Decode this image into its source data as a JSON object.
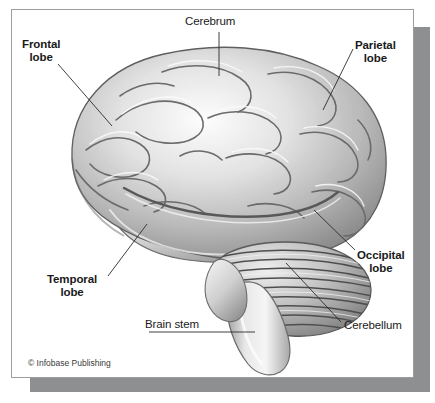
{
  "figure": {
    "copyright": "© Infobase Publishing",
    "card_background": "#ffffff",
    "card_border_color": "#9a9c9e",
    "shadow_color": "#8d8f91",
    "label_color": "#1a1a1a",
    "leader_line_color": "#2b2b2b"
  },
  "labels": [
    {
      "name": "cerebrum",
      "line1": "Cerebrum",
      "line2": "",
      "weight": "regular"
    },
    {
      "name": "frontal-lobe",
      "line1": "Frontal",
      "line2": "lobe",
      "weight": "bold"
    },
    {
      "name": "parietal-lobe",
      "line1": "Parietal",
      "line2": "lobe",
      "weight": "bold"
    },
    {
      "name": "occipital-lobe",
      "line1": "Occipital",
      "line2": "lobe",
      "weight": "bold"
    },
    {
      "name": "temporal-lobe",
      "line1": "Temporal",
      "line2": "lobe",
      "weight": "bold"
    },
    {
      "name": "cerebellum",
      "line1": "Cerebellum",
      "line2": "",
      "weight": "regular"
    },
    {
      "name": "brain-stem",
      "line1": "Brain stem",
      "line2": "",
      "weight": "regular"
    }
  ]
}
